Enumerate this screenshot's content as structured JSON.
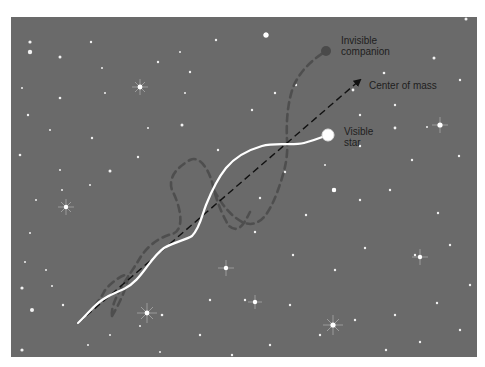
{
  "figure": {
    "background_color": "#6a6a6a",
    "labels": {
      "invisible_companion_line1": "Invisible",
      "invisible_companion_line2": "companion",
      "center_of_mass": "Center of mass",
      "visible_star_line1": "Visible",
      "visible_star_line2": "star"
    },
    "colors": {
      "visible_path": "#ffffff",
      "companion_path": "#4d4d4d",
      "center_of_mass_path": "#111111",
      "visible_star": "#ffffff",
      "companion": "#4a4a4a",
      "label_text": "#1e1e1e"
    },
    "elements": {
      "visible_star": {
        "x": 328,
        "y": 135,
        "r": 6
      },
      "companion": {
        "x": 326,
        "y": 51,
        "r": 5
      },
      "center_of_mass_arrow": {
        "x1": 78,
        "y1": 323,
        "x2": 360,
        "y2": 80
      }
    }
  }
}
